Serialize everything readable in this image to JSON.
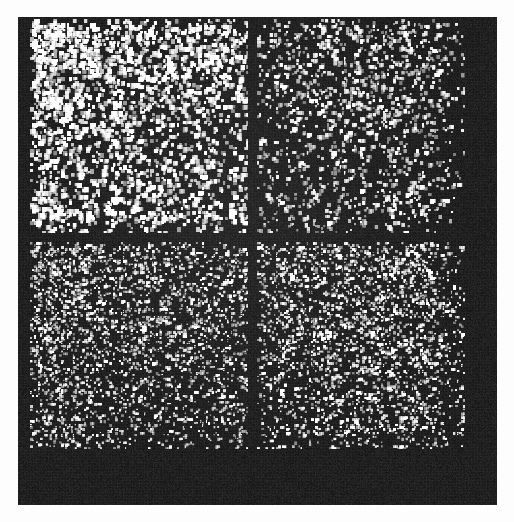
{
  "figure": {
    "kind": "sparse-matrix-spy-plot",
    "page_background": "#fdfdfd",
    "panel_background": "#151515",
    "marker_color": "#ffffff",
    "panel": {
      "x": 18,
      "y": 17,
      "width": 479,
      "height": 488
    }
  },
  "chart_data": {
    "type": "heatmap",
    "title": "",
    "subtitle": "",
    "xlabel": "",
    "ylabel": "",
    "legend": [],
    "legend_position": "none",
    "grid": false,
    "colormap": [
      "#151515",
      "#ffffff"
    ],
    "background": "#151515",
    "marker_color": "#ffffff",
    "matrix": {
      "rows": 214,
      "cols": 214,
      "nnz_estimate": 11800,
      "density_estimate": 0.258,
      "cell_size_px": 2.03,
      "origin": "top-left",
      "data_extent_px": {
        "x0": 30,
        "y0": 19,
        "x1": 465,
        "y1": 449
      }
    },
    "axis_ranges": {
      "xlim": [
        0,
        214
      ],
      "ylim": [
        214,
        0
      ]
    },
    "tick_labels": {
      "x": [],
      "y": []
    },
    "block_structure": {
      "row_split_index": 107,
      "col_split_index": 113,
      "row_gap_px": [
        233,
        241
      ],
      "col_gap_px": [
        248,
        257
      ],
      "blocks": [
        {
          "name": "block-top-left",
          "row_range": [
            0,
            106
          ],
          "col_range": [
            0,
            112
          ],
          "rect_px": {
            "x": 30,
            "y": 19,
            "width": 218,
            "height": 214
          },
          "density": 0.3,
          "marker_size_px": 3.4,
          "brightness": 1.0,
          "clustering": 0.62,
          "note": "Densest block with large bright clustered markers"
        },
        {
          "name": "block-top-right",
          "row_range": [
            0,
            106
          ],
          "col_range": [
            113,
            213
          ],
          "rect_px": {
            "x": 257,
            "y": 19,
            "width": 208,
            "height": 214
          },
          "density": 0.2,
          "marker_size_px": 2.8,
          "brightness": 0.88,
          "clustering": 0.4,
          "note": "Sparser off-diagonal coupling block"
        },
        {
          "name": "block-bottom-left",
          "row_range": [
            107,
            213
          ],
          "col_range": [
            0,
            112
          ],
          "rect_px": {
            "x": 30,
            "y": 242,
            "width": 218,
            "height": 207
          },
          "density": 0.33,
          "marker_size_px": 2.2,
          "brightness": 0.92,
          "clustering": 0.3,
          "note": "Very dense fine-grained scatter"
        },
        {
          "name": "block-bottom-right",
          "row_range": [
            107,
            213
          ],
          "col_range": [
            113,
            213
          ],
          "rect_px": {
            "x": 257,
            "y": 242,
            "width": 208,
            "height": 207
          },
          "density": 0.31,
          "marker_size_px": 2.3,
          "brightness": 0.95,
          "clustering": 0.34,
          "note": "Dense fine-grained scatter, slightly brighter than bottom-left"
        }
      ]
    },
    "empty_margins": {
      "right_band_px": {
        "x": 465,
        "y": 17,
        "width": 32,
        "height": 488
      },
      "bottom_band_px": {
        "x": 18,
        "y": 449,
        "width": 479,
        "height": 56
      },
      "left_band_px": {
        "x": 18,
        "y": 17,
        "width": 12,
        "height": 488
      }
    },
    "row_density_profile": [
      0.22,
      0.34,
      0.41,
      0.46,
      0.44,
      0.39,
      0.45,
      0.48,
      0.43,
      0.4,
      0.47,
      0.5,
      0.44,
      0.38,
      0.42,
      0.46,
      0.41,
      0.36,
      0.44,
      0.48,
      0.39,
      0.33,
      0.4,
      0.45,
      0.38,
      0.3,
      0.36,
      0.42,
      0.35,
      0.28,
      0.34,
      0.39,
      0.32,
      0.26,
      0.31,
      0.37,
      0.3,
      0.24,
      0.29,
      0.35,
      0.27,
      0.21,
      0.26,
      0.32,
      0.25,
      0.19,
      0.24,
      0.3,
      0.23,
      0.18,
      0.22,
      0.28,
      0.21,
      0.16,
      0.2,
      0.26,
      0.19,
      0.15,
      0.18,
      0.24,
      0.17,
      0.13,
      0.17,
      0.22,
      0.16,
      0.12,
      0.15,
      0.2,
      0.14,
      0.11,
      0.14,
      0.18,
      0.13,
      0.1,
      0.13,
      0.17,
      0.12,
      0.09,
      0.12,
      0.16,
      0.11,
      0.09,
      0.11,
      0.15,
      0.1,
      0.08,
      0.1,
      0.14,
      0.17,
      0.22,
      0.28,
      0.33,
      0.3,
      0.24,
      0.2,
      0.26,
      0.31,
      0.27,
      0.22,
      0.18,
      0.14,
      0.1,
      0.07,
      0.05,
      0.03,
      0.02,
      0.01,
      0.18,
      0.3,
      0.38,
      0.42,
      0.4,
      0.36,
      0.41,
      0.44,
      0.39,
      0.37,
      0.43,
      0.45,
      0.4,
      0.35,
      0.39,
      0.42,
      0.38,
      0.34,
      0.4,
      0.43,
      0.37,
      0.33,
      0.38,
      0.41,
      0.36,
      0.32,
      0.37,
      0.4,
      0.35,
      0.31,
      0.36,
      0.39,
      0.34,
      0.3,
      0.35,
      0.38,
      0.33,
      0.29,
      0.34,
      0.37,
      0.32,
      0.28,
      0.33,
      0.36,
      0.31,
      0.27,
      0.32,
      0.35,
      0.3,
      0.26,
      0.31,
      0.34,
      0.29,
      0.25,
      0.3,
      0.33,
      0.28,
      0.24,
      0.29,
      0.32,
      0.27,
      0.23,
      0.28,
      0.31,
      0.26,
      0.22,
      0.27,
      0.3,
      0.25,
      0.21,
      0.26,
      0.29,
      0.24,
      0.2,
      0.25,
      0.28,
      0.23,
      0.19,
      0.24,
      0.27,
      0.22,
      0.18,
      0.23,
      0.26,
      0.21,
      0.17,
      0.22,
      0.25,
      0.2,
      0.16,
      0.21,
      0.24,
      0.19,
      0.15,
      0.2,
      0.23,
      0.26,
      0.24,
      0.2,
      0.16,
      0.12,
      0.08,
      0.05,
      0.03,
      0.02,
      0.01,
      0.01
    ],
    "col_density_profile": [
      0.2,
      0.36,
      0.44,
      0.48,
      0.46,
      0.42,
      0.47,
      0.5,
      0.45,
      0.43,
      0.48,
      0.46,
      0.42,
      0.4,
      0.44,
      0.42,
      0.38,
      0.36,
      0.4,
      0.38,
      0.35,
      0.33,
      0.37,
      0.35,
      0.32,
      0.3,
      0.34,
      0.32,
      0.29,
      0.28,
      0.31,
      0.3,
      0.27,
      0.26,
      0.29,
      0.28,
      0.25,
      0.24,
      0.27,
      0.26,
      0.24,
      0.23,
      0.26,
      0.25,
      0.23,
      0.22,
      0.25,
      0.24,
      0.22,
      0.21,
      0.24,
      0.23,
      0.21,
      0.2,
      0.23,
      0.22,
      0.2,
      0.19,
      0.22,
      0.21,
      0.19,
      0.18,
      0.21,
      0.2,
      0.19,
      0.18,
      0.21,
      0.2,
      0.18,
      0.17,
      0.2,
      0.19,
      0.18,
      0.17,
      0.2,
      0.19,
      0.17,
      0.16,
      0.19,
      0.18,
      0.17,
      0.16,
      0.19,
      0.18,
      0.16,
      0.15,
      0.18,
      0.17,
      0.16,
      0.15,
      0.18,
      0.17,
      0.15,
      0.14,
      0.17,
      0.16,
      0.15,
      0.14,
      0.17,
      0.16,
      0.15,
      0.14,
      0.16,
      0.15,
      0.14,
      0.13,
      0.16,
      0.15,
      0.14,
      0.13,
      0.15,
      0.14,
      0.13,
      0.16,
      0.24,
      0.28,
      0.26,
      0.23,
      0.27,
      0.3,
      0.27,
      0.24,
      0.28,
      0.31,
      0.28,
      0.25,
      0.29,
      0.32,
      0.29,
      0.26,
      0.3,
      0.33,
      0.3,
      0.27,
      0.31,
      0.34,
      0.31,
      0.28,
      0.32,
      0.35,
      0.32,
      0.29,
      0.33,
      0.36,
      0.33,
      0.3,
      0.34,
      0.37,
      0.34,
      0.31,
      0.35,
      0.38,
      0.35,
      0.32,
      0.36,
      0.39,
      0.36,
      0.33,
      0.37,
      0.4,
      0.37,
      0.34,
      0.38,
      0.41,
      0.38,
      0.35,
      0.39,
      0.42,
      0.39,
      0.36,
      0.4,
      0.43,
      0.4,
      0.37,
      0.41,
      0.44,
      0.41,
      0.38,
      0.42,
      0.45,
      0.42,
      0.39,
      0.43,
      0.44,
      0.4,
      0.36,
      0.4,
      0.43,
      0.39,
      0.35,
      0.38,
      0.41,
      0.37,
      0.33,
      0.36,
      0.39,
      0.35,
      0.3,
      0.26,
      0.22,
      0.18,
      0.14,
      0.1,
      0.07,
      0.05,
      0.03,
      0.02,
      0.01,
      0.01,
      0.01,
      0.01,
      0.01,
      0.01,
      0.01
    ],
    "random_seed": 20240517
  }
}
